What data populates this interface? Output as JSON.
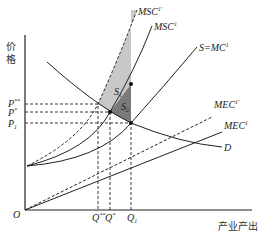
{
  "diagram": {
    "axes": {
      "y_label": "价格",
      "x_label": "产业产出",
      "origin_label": "O"
    },
    "price_levels": [
      {
        "label": "P",
        "sup": "**"
      },
      {
        "label": "P",
        "sup": "*"
      },
      {
        "label": "P",
        "sub": "1"
      }
    ],
    "quantity_levels": [
      {
        "label": "Q",
        "sup": "**"
      },
      {
        "label": "Q",
        "sup": "*"
      },
      {
        "label": "Q",
        "sub": "1"
      }
    ],
    "curves": [
      {
        "id": "msc1-prime",
        "label": "MSC",
        "sup": "1'",
        "style": "dashed"
      },
      {
        "id": "msc1",
        "label": "MSC",
        "sup": "1",
        "style": "solid"
      },
      {
        "id": "supply",
        "label": "S=MC",
        "sup": "1",
        "style": "solid"
      },
      {
        "id": "mec1-prime",
        "label": "MEC",
        "sup": "1'",
        "style": "dashed"
      },
      {
        "id": "mec1",
        "label": "MEC",
        "sup": "1",
        "style": "solid"
      },
      {
        "id": "demand",
        "label": "D",
        "style": "solid"
      }
    ],
    "areas": [
      {
        "label": "S",
        "sub": "1",
        "color": "#c8c8c8"
      },
      {
        "label": "S",
        "sub": "2",
        "color": "#7a7a7a"
      }
    ]
  }
}
